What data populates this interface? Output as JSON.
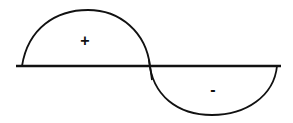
{
  "diagram": {
    "type": "half-wave-lobes",
    "positive_lobe": {
      "label": "+"
    },
    "negative_lobe": {
      "label": "-"
    },
    "colors": {
      "stroke": "#111111",
      "background": "#ffffff"
    }
  }
}
